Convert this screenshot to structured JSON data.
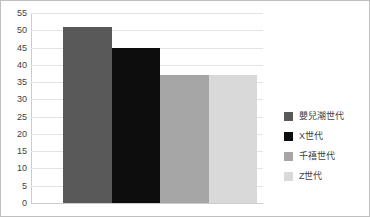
{
  "chart_data": {
    "type": "bar",
    "title": "",
    "subtitle": "",
    "xlabel": "",
    "ylabel": "",
    "categories": [
      "嬰兒潮世代",
      "X世代",
      "千禧世代",
      "Z世代"
    ],
    "values": [
      51,
      45,
      37,
      37
    ],
    "series": [
      {
        "name": "",
        "values": [
          51,
          45,
          37,
          37
        ]
      }
    ],
    "colors": [
      "#595959",
      "#0d0d0d",
      "#a6a6a6",
      "#d9d9d9"
    ],
    "ylim": [
      0,
      55
    ],
    "ytick_step": 5,
    "ytick_labels": [
      "0",
      "5",
      "10",
      "15",
      "20",
      "25",
      "30",
      "35",
      "40",
      "45",
      "50",
      "55"
    ],
    "xtick_labels": [],
    "grid": "horizontal",
    "legend_position": "right",
    "legend": [
      {
        "label": "嬰兒潮世代",
        "color": "#595959"
      },
      {
        "label": "X世代",
        "color": "#0d0d0d"
      },
      {
        "label": "千禧世代",
        "color": "#a6a6a6"
      },
      {
        "label": "Z世代",
        "color": "#d9d9d9"
      }
    ],
    "annotations": []
  }
}
